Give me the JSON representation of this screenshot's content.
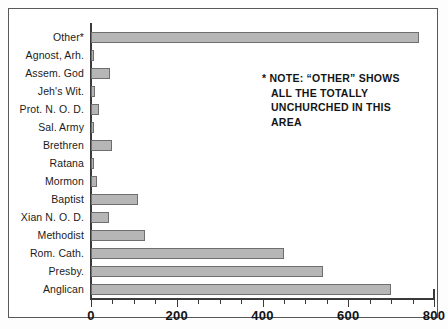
{
  "chart_data": {
    "type": "bar",
    "orientation": "horizontal",
    "title": "",
    "xlabel": "",
    "ylabel": "",
    "xlim": [
      0,
      800
    ],
    "grid": false,
    "legend": null,
    "categories": [
      "Other*",
      "Agnost, Arh.",
      "Assem. God",
      "Jeh's Wit.",
      "Prot. N. O. D.",
      "Sal. Army",
      "Brethren",
      "Ratana",
      "Mormon",
      "Baptist",
      "Xian N. O. D.",
      "Methodist",
      "Rom. Cath.",
      "Presby.",
      "Anglican"
    ],
    "values": [
      765,
      7,
      45,
      9,
      18,
      8,
      50,
      7,
      15,
      110,
      42,
      125,
      450,
      540,
      700
    ],
    "xticks": [
      0,
      200,
      400,
      600,
      800
    ],
    "xtick_labels": [
      "0",
      "200",
      "400",
      "600",
      "800"
    ],
    "xminor_step": 50,
    "bar_fill": "#b6b6b6",
    "bar_stroke": "#6e6e6e",
    "axis_color": "#3a3a3a"
  },
  "note": {
    "lines": [
      "* NOTE: “OTHER” SHOWS",
      "ALL THE TOTALLY",
      "UNCHURCHED IN THIS",
      "AREA"
    ]
  }
}
